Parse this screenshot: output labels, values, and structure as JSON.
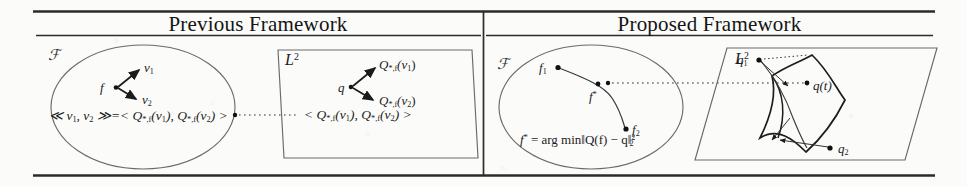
{
  "figure": {
    "caption_type": "two-panel comparison figure",
    "panels": [
      {
        "id": "previous",
        "title": "Previous Framework",
        "domain_label": "ℱ",
        "codomain_label": "L²",
        "base_point": "f",
        "tangent_vectors": [
          "v₁",
          "v₂"
        ],
        "image_point": "q",
        "image_vectors": [
          "Qₓ,ƒ(v₁)",
          "Qₓ,ƒ(v₂)"
        ],
        "domain_equation": "≪ v₁, v₂ ≫=< Qₓ,ƒ(v₁), Qₓ,ƒ(v₂) >",
        "codomain_equation": "< Qₓ,ƒ(v₁), Qₓ,ƒ(v₂) >"
      },
      {
        "id": "proposed",
        "title": "Proposed Framework",
        "domain_label": "ℱ",
        "codomain_label": "L²",
        "curve_points": [
          "f₁",
          "f*",
          "f₂"
        ],
        "image_points": [
          "q₁",
          "q₂"
        ],
        "image_curve_label": "q(t)",
        "objective": "f* = arg min‖Q(f) − q‖²₂"
      }
    ]
  },
  "previous": {
    "title": "Previous Framework",
    "f_space": "ℱ",
    "l2_space": "L",
    "l2_exp": "2",
    "f_point": "f",
    "v1": "v",
    "v1_sub": "1",
    "v2": "v",
    "v2_sub": "2",
    "q_point": "q",
    "qv1_Q": "Q",
    "qv1_sub": "*,f",
    "qv1_arg": "(v",
    "qv1_arg_sub": "1",
    "qv1_close": ")",
    "qv2_Q": "Q",
    "qv2_sub": "*,f",
    "qv2_arg": "(v",
    "qv2_arg_sub": "2",
    "qv2_close": ")",
    "eq_left_open": "≪ v",
    "eq_left_s1": "1",
    "eq_left_mid": ", v",
    "eq_left_s2": "2",
    "eq_left_close": " ≫=< Q",
    "eq_left_q1sub": "*,f",
    "eq_left_q1arg": "(v",
    "eq_left_q1argsub": "1",
    "eq_left_q1close": "), Q",
    "eq_left_q2sub": "*,f",
    "eq_left_q2arg": "(v",
    "eq_left_q2argsub": "2",
    "eq_left_q2close": ") >",
    "eq_right_open": "< Q",
    "eq_right_q1sub": "*,f",
    "eq_right_q1arg": "(v",
    "eq_right_q1argsub": "1",
    "eq_right_q1close": "), Q",
    "eq_right_q2sub": "*,f",
    "eq_right_q2arg": "(v",
    "eq_right_q2argsub": "2",
    "eq_right_q2close": ") >"
  },
  "proposed": {
    "title": "Proposed Framework",
    "f_space": "ℱ",
    "l2_space": "L",
    "l2_exp": "2",
    "f1": "f",
    "f1_sub": "1",
    "fstar": "f",
    "fstar_sup": "*",
    "f2": "f",
    "f2_sub": "2",
    "q1": "q",
    "q1_sub": "1",
    "q2": "q",
    "q2_sub": "2",
    "qt": "q(t)",
    "obj_f": "f",
    "obj_star": "*",
    "obj_eq": " = arg min‖Q(f) − q‖",
    "obj_sup": "2",
    "obj_sub": "2"
  },
  "colors": {
    "ink": "#1a1a1a",
    "rule": "#2b2b2b",
    "outline": "#5a5a5a",
    "manifold": "#222222",
    "paper": "#fbfbfa"
  }
}
